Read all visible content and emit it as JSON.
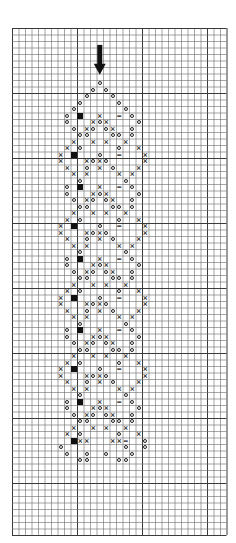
{
  "chart": {
    "title": "",
    "type": "knitting-chart",
    "grid": {
      "cols": 33,
      "rows": 78,
      "cell": 6.5,
      "origin_x": 12,
      "origin_y": 28,
      "line_color": "#6a6a6a",
      "heavy_line_color": "#3a3a3a"
    },
    "start_arrow": {
      "col": 13.5,
      "row_top": 2.6,
      "row_bottom": 7.2,
      "color": "#111111",
      "label": "start-arrow"
    },
    "legend_symbols": [
      {
        "key": "O",
        "name": "circle"
      },
      {
        "key": "x",
        "name": "cross"
      },
      {
        "key": "#",
        "name": "filled-square"
      },
      {
        "key": "=",
        "name": "double-bar"
      }
    ],
    "pattern_origin_col": 7,
    "pattern_origin_row": 8,
    "pattern_rows": [
      "......O.......",
      ".....O.O......",
      "....O...O.....",
      "...O.....O....",
      "..O.......O...",
      ".O.#..x..=.O..",
      ".O...xOx....O.",
      "..O.xO.Ox..O..",
      "...OO...OO.O..",
      "..x..x.x..x...",
      ".x.O.....O..x.",
      "x.#...O..=...x",
      "x...xOxO.....x",
      ".x..O.x.O...x.",
      "..x.x....x.x..",
      "...O......O...",
      ".O.#..x..=.O..",
      ".O...xOx....O.",
      "..O.xO.Ox..O..",
      "...OO...OO.O..",
      "..x..x.x..x...",
      ".x.O.....O..x.",
      "x.#...O..=...x",
      "x...xOxO.....x",
      ".x..O.x.O...x.",
      "..x.x....x.x..",
      "...O......O...",
      ".O.#..x..=.O..",
      ".O...xOx....O.",
      "..O.xO.Ox..O..",
      "...OO...OO.O..",
      "..x..x.x..x...",
      ".x.O.....O..x.",
      "x.#...O..=...x",
      "x...xOxO.....x",
      ".x..O.x.O...x.",
      "..x.x....x.x..",
      "...O......O...",
      ".O.#..x..=.O..",
      ".O...xOx....O.",
      "..O.xO.Ox..O..",
      "...OO...OO.O..",
      "..x..x.x..x...",
      ".x.O.....O..x.",
      "x.#...O..=...x",
      "x...xOxO.....x",
      ".x..O.x.O...x.",
      "..x.x....x.x..",
      "...O......O...",
      ".O.#..x..=.O..",
      ".O...xOx....O.",
      "..O.xO.Ox..O..",
      "...OO...OO.O..",
      "..x..x.x..x...",
      ".x.O.....O..x.",
      "..#xx...xx=..O",
      "O.........O..O",
      ".O..O..O...O..",
      "...OO....OO..."
    ]
  }
}
